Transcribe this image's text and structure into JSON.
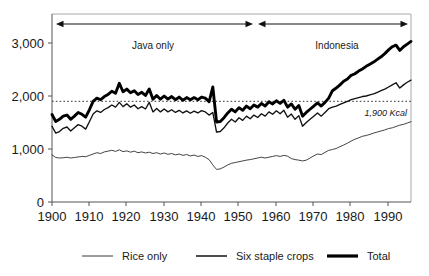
{
  "chart_data": {
    "type": "line",
    "title": "",
    "subtitle": "",
    "xlabel": "",
    "ylabel": "",
    "xlim": [
      1900,
      1996
    ],
    "ylim": [
      0,
      3200
    ],
    "grid": false,
    "legend_position": "bottom",
    "x_ticks": [
      "1900",
      "1910",
      "1920",
      "1930",
      "1940",
      "1950",
      "1960",
      "1970",
      "1980",
      "1990"
    ],
    "x_tick_values": [
      1900,
      1910,
      1920,
      1930,
      1940,
      1950,
      1960,
      1970,
      1980,
      1990
    ],
    "y_ticks": [
      "0",
      "1,000",
      "2,000",
      "3,000"
    ],
    "y_tick_values": [
      0,
      1000,
      2000,
      3000
    ],
    "reference_line": {
      "value": 1900,
      "label": "1,900 Kcal",
      "style": "dotted"
    },
    "annotations": [
      {
        "label": "Java only",
        "x_start": 1900,
        "x_end": 1951,
        "style": "double-arrow"
      },
      {
        "label": "Indonesia",
        "x_start": 1953,
        "x_end": 1996,
        "style": "double-arrow"
      }
    ],
    "legend": [
      {
        "name": "Rice only",
        "weight": "thin"
      },
      {
        "name": "Six staple crops",
        "weight": "medium"
      },
      {
        "name": "Total",
        "weight": "thick"
      }
    ],
    "x": [
      1900,
      1901,
      1902,
      1903,
      1904,
      1905,
      1906,
      1907,
      1908,
      1909,
      1910,
      1911,
      1912,
      1913,
      1914,
      1915,
      1916,
      1917,
      1918,
      1919,
      1920,
      1921,
      1922,
      1923,
      1924,
      1925,
      1926,
      1927,
      1928,
      1929,
      1930,
      1931,
      1932,
      1933,
      1934,
      1935,
      1936,
      1937,
      1938,
      1939,
      1940,
      1941,
      1942,
      1943,
      1944,
      1945,
      1946,
      1947,
      1948,
      1949,
      1950,
      1951,
      1952,
      1953,
      1954,
      1955,
      1956,
      1957,
      1958,
      1959,
      1960,
      1961,
      1962,
      1963,
      1964,
      1965,
      1966,
      1967,
      1968,
      1969,
      1970,
      1971,
      1972,
      1973,
      1974,
      1975,
      1976,
      1977,
      1978,
      1979,
      1980,
      1981,
      1982,
      1983,
      1984,
      1985,
      1986,
      1987,
      1988,
      1989,
      1990,
      1991,
      1992,
      1993,
      1994,
      1995,
      1996
    ],
    "series": [
      {
        "name": "Rice only",
        "values": [
          890,
          840,
          830,
          835,
          845,
          830,
          840,
          850,
          860,
          855,
          880,
          905,
          930,
          915,
          945,
          960,
          975,
          955,
          985,
          950,
          965,
          940,
          960,
          930,
          945,
          925,
          940,
          915,
          930,
          905,
          925,
          900,
          915,
          890,
          905,
          880,
          895,
          870,
          885,
          860,
          875,
          845,
          800,
          700,
          615,
          625,
          660,
          700,
          730,
          745,
          760,
          775,
          790,
          800,
          815,
          830,
          845,
          830,
          845,
          860,
          875,
          860,
          880,
          865,
          820,
          800,
          790,
          775,
          790,
          830,
          870,
          905,
          895,
          935,
          975,
          990,
          1010,
          1045,
          1075,
          1110,
          1150,
          1185,
          1210,
          1240,
          1255,
          1275,
          1300,
          1320,
          1340,
          1360,
          1385,
          1400,
          1425,
          1450,
          1465,
          1490,
          1515
        ]
      },
      {
        "name": "Six staple crops",
        "values": [
          1430,
          1300,
          1330,
          1390,
          1415,
          1340,
          1400,
          1460,
          1430,
          1375,
          1515,
          1660,
          1720,
          1690,
          1745,
          1780,
          1830,
          1790,
          1880,
          1800,
          1855,
          1790,
          1830,
          1760,
          1800,
          1755,
          1880,
          1700,
          1765,
          1700,
          1755,
          1700,
          1740,
          1690,
          1730,
          1680,
          1720,
          1675,
          1715,
          1680,
          1725,
          1700,
          1640,
          1690,
          1320,
          1330,
          1400,
          1490,
          1560,
          1510,
          1590,
          1540,
          1620,
          1570,
          1640,
          1595,
          1665,
          1620,
          1700,
          1655,
          1720,
          1665,
          1730,
          1600,
          1660,
          1560,
          1630,
          1430,
          1500,
          1560,
          1620,
          1680,
          1620,
          1690,
          1760,
          1790,
          1810,
          1840,
          1870,
          1900,
          1930,
          1950,
          1970,
          1990,
          2000,
          2020,
          2040,
          2070,
          2100,
          2130,
          2170,
          2210,
          2250,
          2150,
          2210,
          2260,
          2300
        ]
      },
      {
        "name": "Total",
        "values": [
          1650,
          1520,
          1560,
          1620,
          1640,
          1560,
          1620,
          1690,
          1655,
          1600,
          1740,
          1900,
          1960,
          1930,
          1990,
          2030,
          2090,
          2050,
          2240,
          2080,
          2130,
          2060,
          2100,
          2030,
          2070,
          2010,
          2130,
          1940,
          2010,
          1940,
          2000,
          1940,
          1990,
          1930,
          1980,
          1920,
          1970,
          1930,
          1970,
          1930,
          1980,
          1960,
          1890,
          2170,
          1510,
          1520,
          1590,
          1680,
          1750,
          1700,
          1780,
          1730,
          1810,
          1760,
          1830,
          1790,
          1860,
          1810,
          1890,
          1850,
          1910,
          1860,
          1920,
          1790,
          1850,
          1750,
          1820,
          1620,
          1690,
          1750,
          1810,
          1870,
          1810,
          1880,
          1960,
          2100,
          2150,
          2210,
          2280,
          2320,
          2390,
          2420,
          2470,
          2510,
          2560,
          2600,
          2640,
          2690,
          2740,
          2800,
          2870,
          2930,
          2960,
          2860,
          2930,
          2980,
          3030
        ]
      }
    ]
  },
  "axes": {
    "y_tick_labels": {
      "t3000": "3,000",
      "t2000": "2,000",
      "t1000": "1,000",
      "t0": "0"
    },
    "x_tick_labels": {
      "t1900": "1900",
      "t1910": "1910",
      "t1920": "1920",
      "t1930": "1930",
      "t1940": "1940",
      "t1950": "1950",
      "t1960": "1960",
      "t1970": "1970",
      "t1980": "1980",
      "t1990": "1990"
    }
  },
  "annotations": {
    "java_label": "Java only",
    "indonesia_label": "Indonesia",
    "reference_label": "1,900 Kcal"
  },
  "legend": {
    "rice_label": "Rice only",
    "six_label": "Six staple crops",
    "total_label": "Total"
  },
  "colors": {
    "line": "#111111",
    "frame": "#a8a8a8",
    "axis": "#555555",
    "text": "#1a1a1a",
    "background": "#ffffff"
  }
}
